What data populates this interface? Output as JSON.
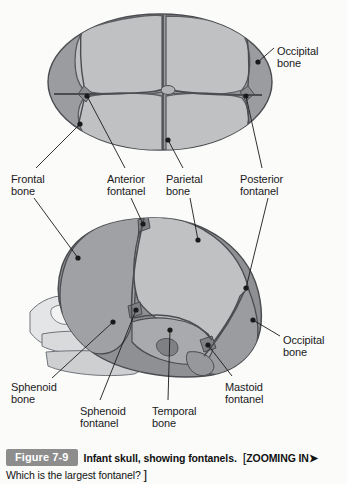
{
  "figure": {
    "badge": "Figure 7-9",
    "title": "Infant skull, showing fontanels.",
    "zoom_prompt": "ZOOMING IN",
    "arrow_glyph": "➤",
    "open_bracket": "[",
    "close_bracket": "]",
    "question": "Which is the largest fontanel?"
  },
  "colors": {
    "background": "#fbfbfa",
    "bone_dark": "#8e9094",
    "bone_medium": "#a3a5a8",
    "bone_light": "#bfc1c3",
    "bone_pale": "#d4d5d6",
    "bone_palest": "#e8e8e8",
    "suture": "#4a4c50",
    "leader": "#1a1a1a",
    "badge": "#8d8d8d",
    "text": "#1a1a1a"
  },
  "views": {
    "superior": {
      "name": "superior-view",
      "description": "Top-down view of infant skull"
    },
    "lateral": {
      "name": "lateral-view",
      "description": "Side view of infant skull"
    }
  },
  "labels": [
    {
      "id": "occipital-bone-top",
      "line1": "Occipital",
      "line2": "bone",
      "x": 277,
      "y": 46
    },
    {
      "id": "frontal-bone",
      "line1": "Frontal",
      "line2": "bone",
      "x": 11,
      "y": 174
    },
    {
      "id": "anterior-fontanel",
      "line1": "Anterior",
      "line2": "fontanel",
      "x": 107,
      "y": 174
    },
    {
      "id": "parietal-bone",
      "line1": "Parietal",
      "line2": "bone",
      "x": 166,
      "y": 174
    },
    {
      "id": "posterior-fontanel",
      "line1": "Posterior",
      "line2": "fontanel",
      "x": 240,
      "y": 174
    },
    {
      "id": "occipital-bone-bottom",
      "line1": "Occipital",
      "line2": "bone",
      "x": 283,
      "y": 335
    },
    {
      "id": "sphenoid-bone",
      "line1": "Sphenoid",
      "line2": "bone",
      "x": 11,
      "y": 382
    },
    {
      "id": "sphenoid-fontanel",
      "line1": "Sphenoid",
      "line2": "fontanel",
      "x": 80,
      "y": 406
    },
    {
      "id": "temporal-bone",
      "line1": "Temporal",
      "line2": "bone",
      "x": 152,
      "y": 406
    },
    {
      "id": "mastoid-fontanel",
      "line1": "Mastoid",
      "line2": "fontanel",
      "x": 225,
      "y": 382
    }
  ]
}
